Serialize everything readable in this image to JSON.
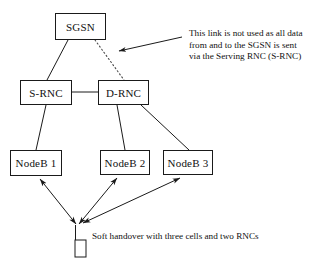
{
  "diagram": {
    "title": "Soft handover with three cells and two RNCs",
    "background_color": "#ffffff",
    "line_color": "#1a1a1a",
    "text_color": "#111111",
    "nodes": [
      {
        "id": "sgsn",
        "label": "SGSN",
        "x": 55,
        "y": 13,
        "w": 51,
        "h": 27
      },
      {
        "id": "srnc",
        "label": "S-RNC",
        "x": 20,
        "y": 80,
        "w": 52,
        "h": 25
      },
      {
        "id": "drnc",
        "label": "D-RNC",
        "x": 98,
        "y": 80,
        "w": 51,
        "h": 25
      },
      {
        "id": "nodeb1",
        "label": "NodeB 1",
        "x": 10,
        "y": 150,
        "w": 52,
        "h": 26
      },
      {
        "id": "nodeb2",
        "label": "NodeB 2",
        "x": 100,
        "y": 150,
        "w": 50,
        "h": 25
      },
      {
        "id": "nodeb3",
        "label": "NodeB 3",
        "x": 163,
        "y": 150,
        "w": 50,
        "h": 25
      }
    ],
    "links": [
      {
        "id": "sgsn-srnc",
        "from": "sgsn",
        "to": "srnc",
        "style": "solid"
      },
      {
        "id": "sgsn-drnc",
        "from": "sgsn",
        "to": "drnc",
        "style": "dotted"
      },
      {
        "id": "srnc-drnc",
        "from": "srnc",
        "to": "drnc",
        "style": "solid"
      },
      {
        "id": "srnc-nodeb1",
        "from": "srnc",
        "to": "nodeb1",
        "style": "solid"
      },
      {
        "id": "drnc-nodeb2",
        "from": "drnc",
        "to": "nodeb2",
        "style": "solid"
      },
      {
        "id": "drnc-nodeb3",
        "from": "drnc",
        "to": "nodeb3",
        "style": "solid"
      }
    ],
    "radio_links": [
      {
        "id": "ue-nodeb1",
        "from": "ue",
        "to": "nodeb1",
        "style": "double-arrow"
      },
      {
        "id": "ue-nodeb2",
        "from": "ue",
        "to": "nodeb2",
        "style": "double-arrow"
      },
      {
        "id": "ue-nodeb3",
        "from": "ue",
        "to": "nodeb3",
        "style": "double-arrow"
      }
    ],
    "annotation": {
      "lines": [
        "This link is not used as all data",
        "from and to the SGSN is sent",
        "via the Serving RNC (S-RNC)"
      ],
      "target_link": "sgsn-drnc"
    },
    "caption": "Soft handover with three cells and two RNCs",
    "ue": {
      "id": "ue",
      "icon": "mobile-phone-icon",
      "x": 70,
      "y": 228
    }
  }
}
